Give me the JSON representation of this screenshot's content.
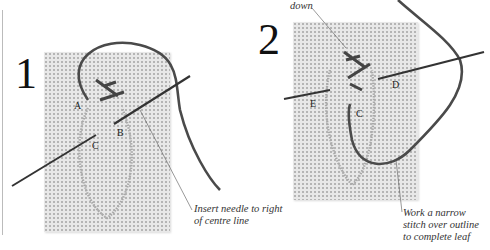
{
  "steps": [
    {
      "number": "1",
      "point_labels": [
        "A",
        "B",
        "C"
      ],
      "caption": [
        "Insert needle to right",
        "of centre line"
      ]
    },
    {
      "number": "2",
      "top_caption": "down",
      "point_labels": [
        "E",
        "C",
        "D"
      ],
      "caption": [
        "Work a narrow",
        "stitch over outline",
        "to complete  leaf"
      ]
    }
  ]
}
